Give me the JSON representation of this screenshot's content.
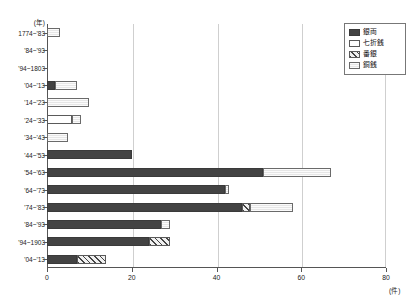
{
  "chart_data": {
    "type": "bar",
    "orientation": "horizontal",
    "stacked": true,
    "title": "",
    "xlabel": "(件)",
    "ylabel": "(年)",
    "xlim": [
      0,
      80
    ],
    "xticks": [
      0,
      20,
      40,
      60,
      80
    ],
    "xtick_labels": [
      "0",
      "20",
      "40",
      "60",
      "80"
    ],
    "grid": true,
    "grid_axis": "x",
    "legend_position": "top-right",
    "categories": [
      "1774~'83",
      "'84~'93",
      "'94~1803",
      "'04~'13",
      "'14~'23",
      "'24~'33",
      "'34~'43",
      "'44~'53",
      "'54~'63",
      "'64~'73",
      "'74~'83",
      "'84~'93",
      "'94~1903",
      "'04~'13"
    ],
    "series": [
      {
        "name": "銀両",
        "key": "ginryo",
        "fill": "solid",
        "color": "#434343",
        "values": [
          0,
          0,
          0,
          2,
          0,
          0,
          0,
          20,
          51,
          42,
          46,
          27,
          24,
          7
        ]
      },
      {
        "name": "七折銭",
        "key": "shichiorisen",
        "fill": "white",
        "color": "#ffffff",
        "values": [
          0,
          0,
          0,
          0,
          0,
          6,
          0,
          0,
          0,
          0,
          0,
          0,
          0,
          0
        ]
      },
      {
        "name": "番銀",
        "key": "bangin",
        "fill": "hatch",
        "color": "#f0f0f0",
        "values": [
          0,
          0,
          0,
          0,
          0,
          0,
          0,
          0,
          0,
          0,
          2,
          0,
          5,
          7
        ]
      },
      {
        "name": "銅銭",
        "key": "dosen",
        "fill": "dot",
        "color": "#e6e6e6",
        "values": [
          3,
          0,
          0,
          5,
          10,
          2,
          5,
          0,
          16,
          1,
          10,
          2,
          0,
          0
        ]
      }
    ]
  },
  "legend": {
    "items": [
      {
        "label": "銀両",
        "fill": "solid"
      },
      {
        "label": "七折銭",
        "fill": "white"
      },
      {
        "label": "番銀",
        "fill": "hatch"
      },
      {
        "label": "銅銭",
        "fill": "dot"
      }
    ]
  }
}
